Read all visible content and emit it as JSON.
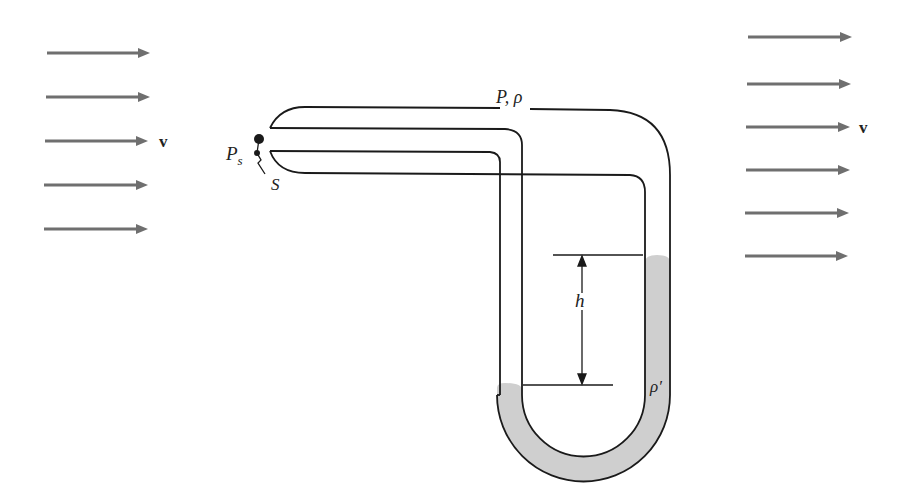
{
  "diagram": {
    "colors": {
      "flow_arrow": "#6f6f6f",
      "tube_line": "#1a1a1a",
      "manometer_fluid": "#cfcfcf",
      "background": "#ffffff"
    },
    "labels": {
      "velocity_left": "v",
      "velocity_right": "v",
      "static_pressure": "P",
      "static_pressure_sub": "s",
      "stagnation_point": "S",
      "pressure_density": "P, ρ",
      "height": "h",
      "fluid_density": "ρ′"
    },
    "flow_arrows": {
      "left": [
        {
          "y": 53,
          "x1": 47,
          "x2": 150
        },
        {
          "y": 97,
          "x1": 46,
          "x2": 150
        },
        {
          "y": 141,
          "x1": 45,
          "x2": 148
        },
        {
          "y": 185,
          "x1": 44,
          "x2": 148
        },
        {
          "y": 229,
          "x1": 44,
          "x2": 148
        }
      ],
      "right": [
        {
          "y": 37,
          "x1": 748,
          "x2": 852
        },
        {
          "y": 84,
          "x1": 747,
          "x2": 851
        },
        {
          "y": 127,
          "x1": 746,
          "x2": 850
        },
        {
          "y": 170,
          "x1": 746,
          "x2": 850
        },
        {
          "y": 213,
          "x1": 745,
          "x2": 849
        },
        {
          "y": 256,
          "x1": 745,
          "x2": 848
        }
      ]
    }
  }
}
